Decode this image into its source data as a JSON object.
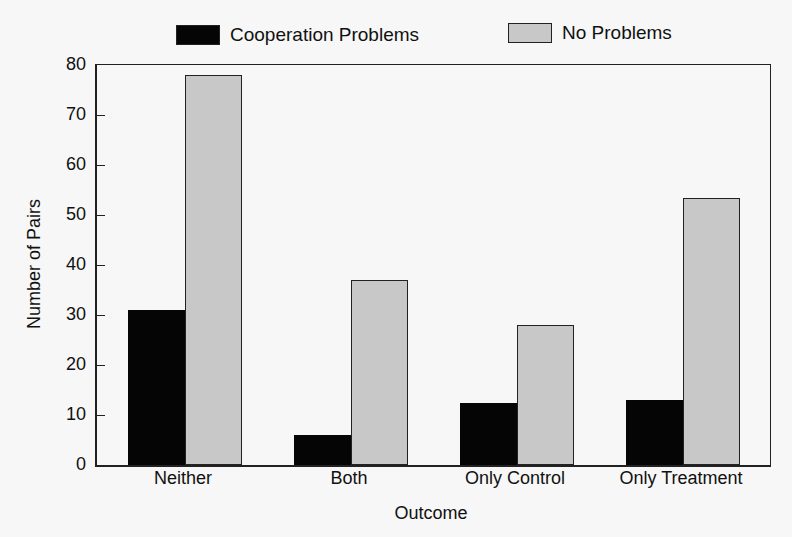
{
  "chart_data": {
    "type": "bar",
    "title": "",
    "xlabel": "Outcome",
    "ylabel": "Number of Pairs",
    "ylim": [
      0,
      80
    ],
    "yticks": [
      0,
      10,
      20,
      30,
      40,
      50,
      60,
      70,
      80
    ],
    "categories": [
      "Neither",
      "Both",
      "Only Control",
      "Only Treatment"
    ],
    "series": [
      {
        "name": "Cooperation Problems",
        "color": "#050505",
        "values": [
          31,
          6,
          12.5,
          13
        ]
      },
      {
        "name": "No Problems",
        "color": "#c8c8c8",
        "values": [
          78,
          37,
          28,
          53.5
        ]
      }
    ],
    "legend_position": "top",
    "grid": false
  },
  "legend": {
    "items": [
      {
        "label": "Cooperation Problems"
      },
      {
        "label": "No Problems"
      }
    ]
  }
}
